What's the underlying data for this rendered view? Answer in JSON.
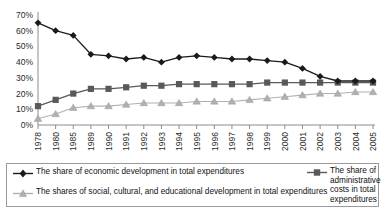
{
  "chart_data": {
    "type": "line",
    "title": "",
    "xlabel": "",
    "ylabel": "",
    "ylim": [
      0,
      70
    ],
    "grid": false,
    "legend_position": "bottom",
    "categories": [
      "1978",
      "1980",
      "1985",
      "1989",
      "1990",
      "1991",
      "1992",
      "1993",
      "1994",
      "1995",
      "1996",
      "1997",
      "1998",
      "1999",
      "2000",
      "2001",
      "2002",
      "2003",
      "2004",
      "2005"
    ],
    "ytick_labels": [
      "0%",
      "10%",
      "20%",
      "30%",
      "40%",
      "50%",
      "60%",
      "70%"
    ],
    "ytick_values": [
      0,
      10,
      20,
      30,
      40,
      50,
      60,
      70
    ],
    "series": [
      {
        "name": "The share of economic development in total expenditures",
        "marker": "diamond",
        "color": "#1a1a1a",
        "values": [
          65,
          60,
          57,
          45,
          44,
          42,
          43,
          40,
          43,
          44,
          43,
          42,
          42,
          41,
          40,
          36,
          31,
          28,
          28,
          28
        ]
      },
      {
        "name": "The share of administrative costs in total expenditures",
        "marker": "square",
        "color": "#595959",
        "values": [
          12,
          16,
          20,
          23,
          23,
          24,
          25,
          25,
          26,
          26,
          26,
          26,
          26,
          27,
          27,
          27,
          27,
          27,
          27,
          27
        ]
      },
      {
        "name": "The shares of social, cultural, and educational development in total expenditures",
        "marker": "triangle",
        "color": "#b0b0b0",
        "values": [
          4,
          7,
          11,
          12,
          12,
          13,
          14,
          14,
          14,
          15,
          15,
          15,
          16,
          17,
          18,
          19,
          20,
          20,
          21,
          21
        ]
      }
    ]
  },
  "legend": {
    "items": [
      {
        "id": "economic-development",
        "label": "The share of economic development in total expenditures",
        "marker": "diamond",
        "color": "#1a1a1a"
      },
      {
        "id": "administrative-costs",
        "label": "The share of administrative costs in total expenditures",
        "marker": "square",
        "color": "#595959"
      },
      {
        "id": "social-cultural-educational",
        "label": "The shares of social, cultural, and educational development in total expenditures",
        "marker": "triangle",
        "color": "#b0b0b0"
      }
    ]
  }
}
